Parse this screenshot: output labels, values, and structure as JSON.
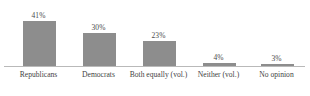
{
  "chart_data": {
    "type": "bar",
    "title": "",
    "subtitle": "",
    "xlabel": "",
    "ylabel": "",
    "ylim": [
      0,
      50
    ],
    "grid": false,
    "legend": null,
    "categories": [
      "Republicans",
      "Democrats",
      "Both equally (vol.)",
      "Neither (vol.)",
      "No opinion"
    ],
    "values": [
      41,
      30,
      23,
      4,
      3
    ],
    "data_labels": [
      "41%",
      "30%",
      "23%",
      "4%",
      "3%"
    ],
    "bar_color": "#8d8d8d",
    "axis_color": "#b9b9b9",
    "label_color": "#3f3f3f"
  },
  "footnote": {
    "text": ""
  }
}
